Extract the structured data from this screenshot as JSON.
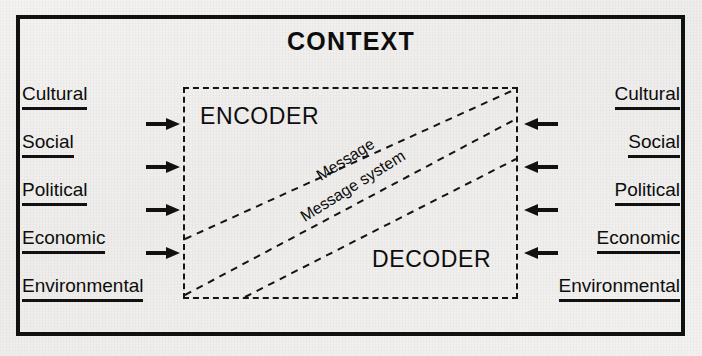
{
  "diagram": {
    "title": "CONTEXT",
    "outer_frame_color": "#111111",
    "background_color": "#f2f1ef",
    "inner_box": {
      "name": "message-system-box",
      "style": "dashed",
      "encoder_label": "ENCODER",
      "decoder_label": "DECODER"
    },
    "diagonal_captions": {
      "upper": "Message",
      "lower": "Message system"
    },
    "left_factors": {
      "heading": "",
      "items": [
        {
          "label": "Cultural"
        },
        {
          "label": "Social"
        },
        {
          "label": "Political"
        },
        {
          "label": "Economic"
        },
        {
          "label": "Environmental"
        }
      ]
    },
    "right_factors": {
      "heading": "",
      "items": [
        {
          "label": "Cultural"
        },
        {
          "label": "Social"
        },
        {
          "label": "Political"
        },
        {
          "label": "Economic"
        },
        {
          "label": "Environmental"
        }
      ]
    },
    "left_arrows": {
      "icon": "arrow-right-icon",
      "count": 4,
      "direction": "right"
    },
    "right_arrows": {
      "icon": "arrow-left-icon",
      "count": 4,
      "direction": "left"
    }
  }
}
